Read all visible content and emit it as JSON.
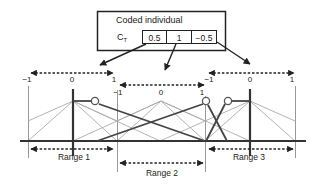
{
  "header": {
    "title": "Coded individual",
    "chromosome_label": "C",
    "chromosome_subscript": "T",
    "genes": [
      "0.5",
      "1",
      "−0.5"
    ]
  },
  "axes": [
    {
      "name": "axis-1",
      "min": "−1",
      "mid": "0",
      "max": "1"
    },
    {
      "name": "axis-2",
      "min": "−1",
      "mid": "0",
      "max": "1"
    },
    {
      "name": "axis-3",
      "min": "−1",
      "mid": "0",
      "max": "1"
    }
  ],
  "ranges": [
    "Range 1",
    "Range 2",
    "Range 3"
  ],
  "colors": {
    "thick_line": "#3a3a3a",
    "thin_line": "#a8a8a8",
    "text": "#222222"
  }
}
